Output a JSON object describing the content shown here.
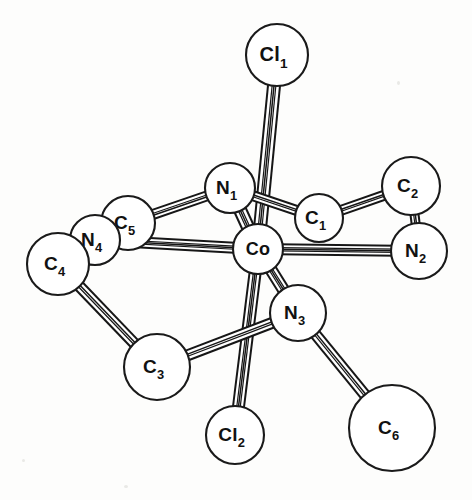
{
  "figure": {
    "background_color": "#fdfdfc",
    "line_color": "#161616",
    "atom_fill": "#ffffff",
    "width": 472,
    "height": 500,
    "style": "ball-and-stick line drawing"
  },
  "atoms": [
    {
      "id": "Cl1",
      "element": "Cl",
      "index": "1",
      "label_base": "Cl",
      "label_sub": "1",
      "cx": 277,
      "cy": 55,
      "r": 31,
      "font_size": 20
    },
    {
      "id": "N1",
      "element": "N",
      "index": "1",
      "label_base": "N",
      "label_sub": "1",
      "cx": 230,
      "cy": 188,
      "r": 25,
      "font_size": 19
    },
    {
      "id": "C1",
      "element": "C",
      "index": "1",
      "label_base": "C",
      "label_sub": "1",
      "cx": 319,
      "cy": 218,
      "r": 24,
      "font_size": 19
    },
    {
      "id": "C2",
      "element": "C",
      "index": "2",
      "label_base": "C",
      "label_sub": "2",
      "cx": 411,
      "cy": 186,
      "r": 29,
      "font_size": 19
    },
    {
      "id": "N2",
      "element": "N",
      "index": "2",
      "label_base": "N",
      "label_sub": "2",
      "cx": 419,
      "cy": 251,
      "r": 28,
      "font_size": 19
    },
    {
      "id": "Co",
      "element": "Co",
      "index": "",
      "label_base": "Co",
      "label_sub": "",
      "cx": 258,
      "cy": 249,
      "r": 25,
      "font_size": 18
    },
    {
      "id": "C5",
      "element": "C",
      "index": "5",
      "label_base": "C",
      "label_sub": "5",
      "cx": 128,
      "cy": 223,
      "r": 27,
      "font_size": 19
    },
    {
      "id": "N4",
      "element": "N",
      "index": "4",
      "label_base": "N",
      "label_sub": "4",
      "cx": 95,
      "cy": 240,
      "r": 25,
      "font_size": 19
    },
    {
      "id": "C4",
      "element": "C",
      "index": "4",
      "label_base": "C",
      "label_sub": "4",
      "cx": 58,
      "cy": 264,
      "r": 31,
      "font_size": 19
    },
    {
      "id": "C3",
      "element": "C",
      "index": "3",
      "label_base": "C",
      "label_sub": "3",
      "cx": 157,
      "cy": 367,
      "r": 33,
      "font_size": 19
    },
    {
      "id": "N3",
      "element": "N",
      "index": "3",
      "label_base": "N",
      "label_sub": "3",
      "cx": 298,
      "cy": 313,
      "r": 28,
      "font_size": 19
    },
    {
      "id": "Cl2",
      "element": "Cl",
      "index": "2",
      "label_base": "Cl",
      "label_sub": "2",
      "cx": 235,
      "cy": 435,
      "r": 29,
      "font_size": 19
    },
    {
      "id": "C6",
      "element": "C",
      "index": "6",
      "label_base": "C",
      "label_sub": "6",
      "cx": 392,
      "cy": 428,
      "r": 43,
      "font_size": 19
    }
  ],
  "bonds": [
    {
      "from": "Co",
      "to": "Cl1",
      "half_width": 6.0,
      "stripes": 3
    },
    {
      "from": "Co",
      "to": "Cl2",
      "half_width": 5.5,
      "stripes": 3
    },
    {
      "from": "Co",
      "to": "N1",
      "half_width": 6.0,
      "stripes": 3
    },
    {
      "from": "Co",
      "to": "N2",
      "half_width": 5.0,
      "stripes": 3
    },
    {
      "from": "Co",
      "to": "N3",
      "half_width": 5.5,
      "stripes": 3
    },
    {
      "from": "Co",
      "to": "N4",
      "half_width": 5.0,
      "stripes": 3
    },
    {
      "from": "N1",
      "to": "C5",
      "half_width": 4.5,
      "stripes": 2
    },
    {
      "from": "N1",
      "to": "C1",
      "half_width": 4.5,
      "stripes": 2
    },
    {
      "from": "C1",
      "to": "C2",
      "half_width": 4.5,
      "stripes": 2
    },
    {
      "from": "C2",
      "to": "N2",
      "half_width": 4.0,
      "stripes": 2
    },
    {
      "from": "N4",
      "to": "C4",
      "half_width": 4.0,
      "stripes": 2
    },
    {
      "from": "C4",
      "to": "C3",
      "half_width": 5.0,
      "stripes": 2
    },
    {
      "from": "C3",
      "to": "N3",
      "half_width": 5.0,
      "stripes": 2
    },
    {
      "from": "N3",
      "to": "C6",
      "half_width": 5.0,
      "stripes": 2
    }
  ],
  "legend": {
    "central_atom": "Co",
    "ligand_atoms": [
      "Cl1",
      "Cl2",
      "N1",
      "N2",
      "N3",
      "N4"
    ],
    "carbon_atoms": [
      "C1",
      "C2",
      "C3",
      "C4",
      "C5",
      "C6"
    ]
  }
}
